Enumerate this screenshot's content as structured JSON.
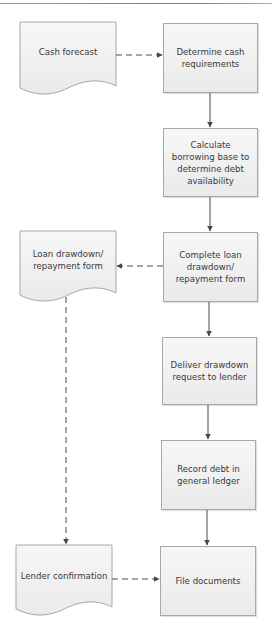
{
  "diagram": {
    "type": "flowchart",
    "colors": {
      "border": "#a8a8a8",
      "fill_top": "#f7f7f7",
      "fill_bottom": "#eaeaea",
      "text": "#3a3a3a",
      "connector": "#4a4a4a"
    },
    "documents": [
      {
        "id": "doc1",
        "label": "Cash forecast"
      },
      {
        "id": "doc2",
        "label": "Loan drawdown/ repayment form"
      },
      {
        "id": "doc3",
        "label": "Lender confirmation"
      }
    ],
    "processes": [
      {
        "id": "p1",
        "label": "Determine cash requirements"
      },
      {
        "id": "p2",
        "label": "Calculate borrowing base to determine debt availability"
      },
      {
        "id": "p3",
        "label": "Complete loan drawdown/ repayment form"
      },
      {
        "id": "p4",
        "label": "Deliver drawdown request to lender"
      },
      {
        "id": "p5",
        "label": "Record debt in general ledger"
      },
      {
        "id": "p6",
        "label": "File documents"
      }
    ],
    "edges": [
      {
        "from": "doc1",
        "to": "p1",
        "style": "dashed"
      },
      {
        "from": "p1",
        "to": "p2",
        "style": "solid"
      },
      {
        "from": "p2",
        "to": "p3",
        "style": "solid"
      },
      {
        "from": "p3",
        "to": "doc2",
        "style": "dashed"
      },
      {
        "from": "p3",
        "to": "p4",
        "style": "solid"
      },
      {
        "from": "p4",
        "to": "p5",
        "style": "solid"
      },
      {
        "from": "p5",
        "to": "p6",
        "style": "solid"
      },
      {
        "from": "doc2",
        "to": "doc3",
        "style": "dashed"
      },
      {
        "from": "doc3",
        "to": "p6",
        "style": "dashed"
      }
    ]
  }
}
